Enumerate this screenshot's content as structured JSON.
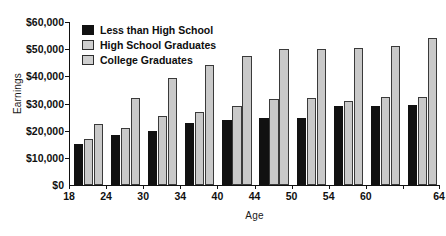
{
  "chart_data": {
    "type": "bar",
    "title": "",
    "xlabel": "Age",
    "ylabel": "Earnings",
    "categories": [
      "18",
      "24",
      "30",
      "34",
      "40",
      "44",
      "50",
      "54",
      "60",
      "64"
    ],
    "series": [
      {
        "name": "Less than High School",
        "color": "#111111",
        "values": [
          15000,
          18500,
          20000,
          23000,
          24000,
          24500,
          24500,
          29000,
          29000,
          29500
        ]
      },
      {
        "name": "High School Graduates",
        "color": "#c9c9c9",
        "values": [
          17000,
          21000,
          25500,
          27000,
          29000,
          31500,
          32000,
          31000,
          32500,
          32500
        ]
      },
      {
        "name": "College Graduates",
        "color": "#c9c9c9",
        "values": [
          22500,
          32000,
          39500,
          44000,
          47500,
          50000,
          50000,
          50500,
          51000,
          54000
        ]
      }
    ],
    "ylim": [
      0,
      60000
    ],
    "ytick_values": [
      0,
      10000,
      20000,
      30000,
      40000,
      50000,
      60000
    ],
    "ytick_labels": [
      "$0",
      "$10,000",
      "$20,000",
      "$30,000",
      "$40,000",
      "$50,000",
      "$60,000"
    ],
    "grid": false,
    "legend_position": "top-left-inside"
  },
  "axes": {
    "y_title": "Earnings",
    "x_title": "Age"
  },
  "legend": {
    "items": [
      {
        "label": "Less than High School"
      },
      {
        "label": "High School Graduates"
      },
      {
        "label": "College Graduates"
      }
    ]
  }
}
